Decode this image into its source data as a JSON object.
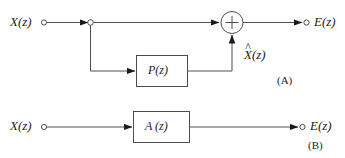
{
  "figure": {
    "type": "block-diagram",
    "background_color": "#ffffff",
    "line_color": "#3a3a3a",
    "text_color": "#1a1a1a"
  },
  "panel_a": {
    "tag": "(A)",
    "input_label": "X(z)",
    "output_label": "E(z)",
    "block_label": "P(z)",
    "feedback_label_base": "X",
    "feedback_label_hat": "^",
    "feedback_label_suffix": "(z)",
    "summing_symbol": "+",
    "summing_operation": "add"
  },
  "panel_b": {
    "tag": "(B)",
    "input_label": "X(z)",
    "output_label": "E(z)",
    "block_label": "A (z)"
  },
  "icons": {
    "terminal": "open-circle-terminal",
    "node": "branch-node-circle",
    "arrow": "filled-arrowhead"
  }
}
